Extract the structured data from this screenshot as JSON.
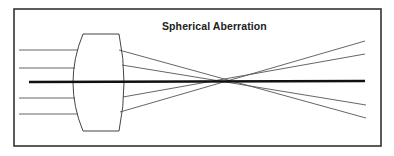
{
  "diagram": {
    "title": "Spherical Aberration",
    "colors": {
      "background": "#ffffff",
      "frame": "#333333",
      "ray": "#555555",
      "axis": "#111111",
      "lens": "#444444",
      "title": "#222222"
    },
    "frame": {
      "x": 14,
      "y": 9,
      "width": 367,
      "height": 137
    },
    "lens": {
      "top": {
        "x1": 83,
        "x2": 119,
        "y": 34
      },
      "bottom": {
        "x1": 83,
        "x2": 119,
        "y": 131
      },
      "left_bulge_x": 73,
      "right_bulge_x": 124
    },
    "axis": {
      "x1": 29,
      "y1": 82,
      "x2": 365,
      "y2": 81
    },
    "incoming_rays": [
      {
        "x1": 19,
        "y1": 50,
        "x2": 78,
        "y2": 50
      },
      {
        "x1": 19,
        "y1": 68,
        "x2": 75,
        "y2": 68
      },
      {
        "x1": 19,
        "y1": 98,
        "x2": 75,
        "y2": 98
      },
      {
        "x1": 19,
        "y1": 114,
        "x2": 78,
        "y2": 114
      }
    ],
    "outgoing_rays": [
      {
        "x1": 119,
        "y1": 50,
        "x2": 366,
        "y2": 118
      },
      {
        "x1": 122,
        "y1": 65,
        "x2": 366,
        "y2": 105
      },
      {
        "x1": 123,
        "y1": 97,
        "x2": 365,
        "y2": 54
      },
      {
        "x1": 120,
        "y1": 112,
        "x2": 365,
        "y2": 41
      }
    ]
  }
}
